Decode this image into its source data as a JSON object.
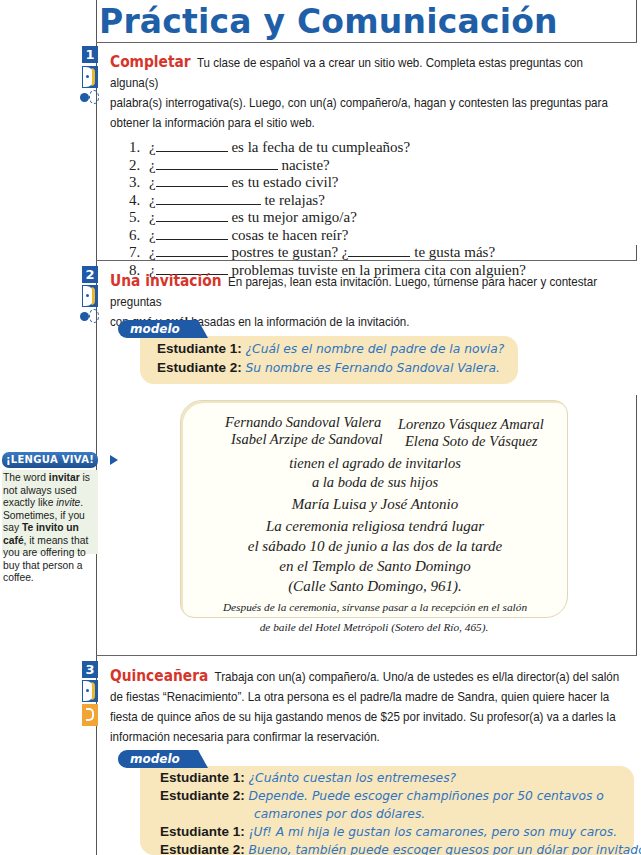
{
  "page_title": "Práctica y Comunicación",
  "activities": [
    {
      "number": "1",
      "title": "Completar",
      "instructions_lines": [
        "Tu clase de español va a crear un sitio web. Completa estas preguntas con alguna(s)",
        "palabra(s) interrogativa(s). Luego, con un(a) compañero/a, hagan y contesten las preguntas para",
        "obtener la información para el sitio web."
      ],
      "icons": [
        "talk-icon",
        "pair-icon"
      ],
      "questions": [
        {
          "n": "1.",
          "pre": "¿",
          "blank1": 72,
          "post": " es la fecha de tu cumpleaños?"
        },
        {
          "n": "2.",
          "pre": "¿",
          "blank1": 122,
          "post": " naciste?"
        },
        {
          "n": "3.",
          "pre": "¿",
          "blank1": 72,
          "post": " es tu estado civil?"
        },
        {
          "n": "4.",
          "pre": "¿",
          "blank1": 105,
          "post": " te relajas?"
        },
        {
          "n": "5.",
          "pre": "¿",
          "blank1": 72,
          "post": " es tu mejor amigo/a?"
        },
        {
          "n": "6.",
          "pre": "¿",
          "blank1": 72,
          "post": " cosas te hacen reír?"
        },
        {
          "n": "7.",
          "pre": "¿",
          "blank1": 72,
          "post": " postres te gustan? ¿",
          "blank2": 62,
          "post2": " te gusta más?"
        },
        {
          "n": "8.",
          "pre": "¿",
          "blank1": 72,
          "post": " problemas tuviste en la primera cita con alguien?"
        }
      ]
    },
    {
      "number": "2",
      "title": "Una invitación",
      "instructions_lines": [
        "En parejas, lean esta invitación. Luego, túrnense para hacer y contestar preguntas",
        "con",
        "qué",
        "y",
        "cuál",
        "basadas en la información de la invitación."
      ],
      "icons": [
        "talk-icon",
        "pair-icon"
      ],
      "modelo_label": "modelo",
      "modelo": [
        {
          "who": "Estudiante 1:",
          "say": "¿Cuál es el nombre del padre de la novia?"
        },
        {
          "who": "Estudiante 2:",
          "say": "Su nombre es Fernando Sandoval Valera."
        }
      ],
      "invitation": {
        "left_parents": [
          "Fernando Sandoval Valera",
          "Isabel Arzipe de Sandoval"
        ],
        "right_parents": [
          "Lorenzo Vásquez Amaral",
          "Elena Soto de Vásquez"
        ],
        "lines": [
          "tienen el agrado de invitarlos",
          "a la boda de sus hijos",
          "María Luisa y José Antonio",
          "La ceremonia religiosa tendrá lugar",
          "el sábado 10 de junio a las dos de la tarde",
          "en el Templo de Santo Domingo",
          "(Calle Santo Domingo, 961)."
        ],
        "footer": [
          "Después de la ceremonia, sírvanse pasar a la recepción en el salón",
          "de baile del Hotel Metrópoli (Sotero del Río, 465)."
        ]
      }
    },
    {
      "number": "3",
      "title": "Quinceañera",
      "instructions_lines": [
        "Trabaja con un(a) compañero/a. Uno/a de ustedes es el/la director(a) del salón",
        "de fiestas “Renacimiento”. La otra persona es el padre/la madre de Sandra, quien quiere hacer la",
        "fiesta de quince años de su hija gastando menos de $25 por invitado. Su profesor(a) va a darles la",
        "información necesaria para confirmar la reservación."
      ],
      "icons": [
        "talk-icon",
        "puzzle-icon"
      ],
      "modelo_label": "modelo",
      "modelo": [
        {
          "who": "Estudiante 1:",
          "say": "¿Cuánto cuestan los entremeses?"
        },
        {
          "who": "Estudiante 2:",
          "say": "Depende. Puede escoger champiñones por 50 centavos o"
        },
        {
          "who": "",
          "say": "camarones por dos dólares."
        },
        {
          "who": "Estudiante 1:",
          "say": "¡Uf! A mi hija le gustan los camarones, pero son muy caros."
        },
        {
          "who": "Estudiante 2:",
          "say": "Bueno, también puede escoger quesos por un dólar por invitado."
        }
      ]
    }
  ],
  "sidebar": {
    "badge": "¡LENGUA VIVA!",
    "parts": [
      "The word ",
      "invitar",
      " is not always used exactly like ",
      "invite",
      ". Sometimes, if you say ",
      "Te invito un café",
      ", it means that you are offering to buy that person a coffee."
    ]
  },
  "colors": {
    "title_blue": "#1f5fa8",
    "activity_red": "#d6352b",
    "modelo_bg": "#f8e7bd",
    "modelo_answer": "#2e74c0",
    "sidebar_bg": "#ecf3e6"
  }
}
